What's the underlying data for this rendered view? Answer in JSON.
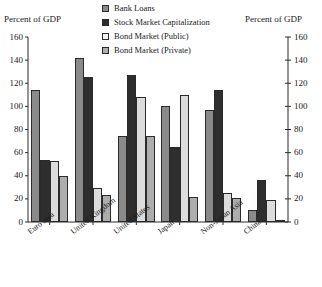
{
  "chart_data": {
    "type": "bar",
    "title": "",
    "xlabel": "",
    "ylabel": "Percent of GDP",
    "ylabel_right": "Percent of GDP",
    "ylim": [
      0,
      160
    ],
    "yticks": [
      0,
      20,
      40,
      60,
      80,
      100,
      120,
      140,
      160
    ],
    "grid": false,
    "legend_position": "top-center",
    "dual_axis": true,
    "categories": [
      "Euro area",
      "United Kingdom",
      "United States",
      "Japan",
      "Non-Japan Asia",
      "China"
    ],
    "series": [
      {
        "name": "Bank Loans",
        "color": "#8a8a8a",
        "values": [
          114,
          142,
          74,
          100,
          97,
          10
        ]
      },
      {
        "name": "Stock Market Capitalization",
        "color": "#2e2e2e",
        "values": [
          54,
          125,
          127,
          65,
          114,
          36
        ]
      },
      {
        "name": "Bond Market (Public)",
        "color": "#dcdcdc",
        "values": [
          53,
          29,
          108,
          110,
          25,
          19
        ]
      },
      {
        "name": "Bond Market (Private)",
        "color": "#adadad",
        "values": [
          39.5,
          23,
          74,
          22,
          21,
          1.5
        ]
      }
    ]
  },
  "axes": {
    "left_title": "Percent of GDP",
    "right_title": "Percent of GDP",
    "tick_labels": [
      "160",
      "140",
      "120",
      "100",
      "80",
      "60",
      "40",
      "20",
      "0"
    ]
  },
  "legend": {
    "items": [
      {
        "label": "Bank Loans",
        "color": "#8a8a8a"
      },
      {
        "label": "Stock Market Capitalization",
        "color": "#2e2e2e"
      },
      {
        "label": "Bond Market (Public)",
        "color": "#f2f2f2"
      },
      {
        "label": "Bond Market (Private)",
        "color": "#adadad"
      }
    ]
  }
}
